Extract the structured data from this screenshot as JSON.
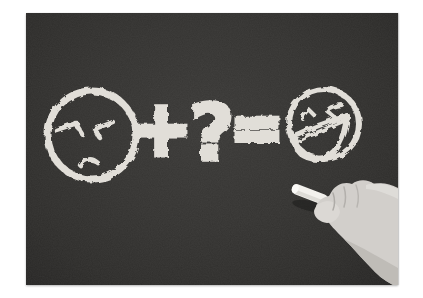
{
  "image": {
    "type": "black-and-white-photograph",
    "alt": "Hand holding a piece of white chalk beside a chalkboard drawing of an unhappy face plus a question mark equals a laughing face"
  },
  "board": {
    "plus": "+",
    "question_mark": "?",
    "equals": "=",
    "left_face": "unhappy-face",
    "right_face": "laughing-face"
  },
  "colors": {
    "page_background": "#ffffff",
    "board_background": "#31302e",
    "chalk": "#e8e5df",
    "hand": "#d2cfcb"
  }
}
